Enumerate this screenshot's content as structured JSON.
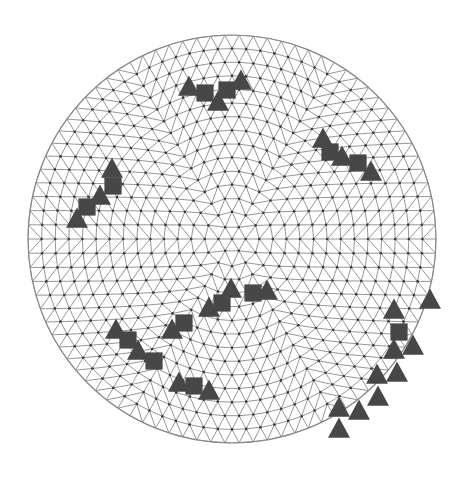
{
  "figure": {
    "width": 468,
    "height": 481,
    "colors": {
      "background": "#ffffff",
      "mesh_line": "#8a8a8a",
      "mesh_node": "#3a3a3a",
      "marker_fill": "#474747"
    }
  },
  "mesh": {
    "shape": "circle",
    "center": [
      232,
      239
    ],
    "radius": 204,
    "edge_length": 13.5,
    "ring_count": 15
  },
  "markers": [
    {
      "shape": "triangle",
      "x": 189,
      "y": 88
    },
    {
      "shape": "square",
      "x": 205,
      "y": 93
    },
    {
      "shape": "triangle",
      "x": 218,
      "y": 103
    },
    {
      "shape": "square",
      "x": 227,
      "y": 90
    },
    {
      "shape": "triangle",
      "x": 241,
      "y": 82
    },
    {
      "shape": "triangle",
      "x": 323,
      "y": 140
    },
    {
      "shape": "square",
      "x": 330,
      "y": 152
    },
    {
      "shape": "triangle",
      "x": 342,
      "y": 158
    },
    {
      "shape": "square",
      "x": 358,
      "y": 163
    },
    {
      "shape": "triangle",
      "x": 371,
      "y": 173
    },
    {
      "shape": "triangle",
      "x": 112,
      "y": 170
    },
    {
      "shape": "square",
      "x": 113,
      "y": 186
    },
    {
      "shape": "triangle",
      "x": 100,
      "y": 197
    },
    {
      "shape": "square",
      "x": 87,
      "y": 207
    },
    {
      "shape": "triangle",
      "x": 77,
      "y": 220
    },
    {
      "shape": "triangle",
      "x": 116,
      "y": 331
    },
    {
      "shape": "square",
      "x": 128,
      "y": 340
    },
    {
      "shape": "triangle",
      "x": 138,
      "y": 352
    },
    {
      "shape": "square",
      "x": 154,
      "y": 361
    },
    {
      "shape": "triangle",
      "x": 172,
      "y": 331
    },
    {
      "shape": "square",
      "x": 184,
      "y": 323
    },
    {
      "shape": "triangle",
      "x": 209,
      "y": 309
    },
    {
      "shape": "square",
      "x": 222,
      "y": 303
    },
    {
      "shape": "triangle",
      "x": 231,
      "y": 290
    },
    {
      "shape": "square",
      "x": 253,
      "y": 293
    },
    {
      "shape": "triangle",
      "x": 267,
      "y": 292
    },
    {
      "shape": "triangle",
      "x": 179,
      "y": 384
    },
    {
      "shape": "square",
      "x": 194,
      "y": 386
    },
    {
      "shape": "triangle",
      "x": 209,
      "y": 392
    },
    {
      "shape": "triangle",
      "x": 430,
      "y": 301
    },
    {
      "shape": "triangle",
      "x": 394,
      "y": 311
    },
    {
      "shape": "square",
      "x": 399,
      "y": 332
    },
    {
      "shape": "triangle",
      "x": 394,
      "y": 351
    },
    {
      "shape": "triangle",
      "x": 413,
      "y": 347
    },
    {
      "shape": "triangle",
      "x": 377,
      "y": 376
    },
    {
      "shape": "triangle",
      "x": 397,
      "y": 374
    },
    {
      "shape": "triangle",
      "x": 378,
      "y": 398
    },
    {
      "shape": "triangle",
      "x": 339,
      "y": 409
    },
    {
      "shape": "triangle",
      "x": 359,
      "y": 412
    },
    {
      "shape": "triangle",
      "x": 339,
      "y": 430
    }
  ],
  "marker_size": 22,
  "legend": {
    "triangle": "triangle-marker",
    "square": "square-marker"
  }
}
